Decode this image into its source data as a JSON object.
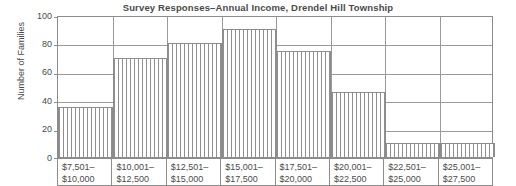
{
  "chart_data": {
    "type": "bar",
    "title": "Survey Responses–Annual Income, Drendel Hill Township",
    "xlabel": "",
    "ylabel": "Number of Families",
    "ylim": [
      0,
      100
    ],
    "yticks": [
      0,
      20,
      40,
      60,
      80,
      100
    ],
    "grid": true,
    "legend": "none",
    "categories": [
      "$7,501–$10,000",
      "$10,001–$12,500",
      "$12,501–$15,000",
      "$15,001–$17,500",
      "$17,501–$20,000",
      "$20,001–$22,500",
      "$22,501–$25,000",
      "$25,001–$27,500"
    ],
    "category_lines": [
      [
        "$7,501–",
        "$10,000"
      ],
      [
        "$10,001–",
        "$12,500"
      ],
      [
        "$12,501–",
        "$15,000"
      ],
      [
        "$15,001–",
        "$17,500"
      ],
      [
        "$17,501–",
        "$20,000"
      ],
      [
        "$20,001–",
        "$22,500"
      ],
      [
        "$22,501–",
        "$25,000"
      ],
      [
        "$25,001–",
        "$27,500"
      ]
    ],
    "values": [
      35,
      70,
      80,
      90,
      75,
      46,
      10,
      10
    ],
    "bar_style": "vertical-hatch",
    "colors": {
      "axis": "#8c8c8c",
      "grid": "#9a9a9a",
      "text": "#4a4a4a",
      "bar_hatch": "#8f8f8f",
      "background": "#ffffff"
    }
  }
}
